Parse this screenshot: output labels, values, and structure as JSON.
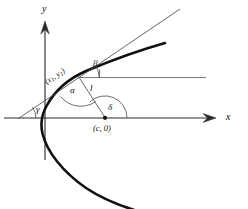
{
  "figure": {
    "kind": "geometry-diagram",
    "background_color": "#ffffff",
    "ink_color": "#0d0d0d",
    "thin_line_color": "#5a5a5a"
  },
  "axes": {
    "x_label": "x",
    "y_label": "y",
    "x_axis_has_arrow": true,
    "y_axis_has_arrow": true
  },
  "labels": {
    "point_on_curve": "(x₁, y₁)",
    "point_on_curve_parts": {
      "open": "(",
      "x": "x",
      "xsub": "1",
      "comma": ", ",
      "y": "y",
      "ysub": "1",
      "close": ")"
    },
    "focus_point": "(c, 0)",
    "focus_parts": {
      "open": "(",
      "c": "c",
      "comma": ", ",
      "zero": "0",
      "close": ")"
    },
    "angle_alpha": "α",
    "angle_beta": "β",
    "angle_gamma": "γ",
    "angle_delta": "δ",
    "segment_l": "l"
  },
  "elements": {
    "curve_name": "parabola-curve",
    "tangent_name": "tangent-line",
    "horizontal_ray_name": "horizontal-ray",
    "focal_segment_name": "focal-segment",
    "focus_dot_name": "focus-point-dot"
  }
}
